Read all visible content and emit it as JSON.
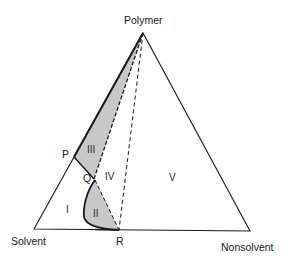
{
  "diagram": {
    "type": "ternary-phase-diagram",
    "vertices": {
      "top": "Polymer",
      "bottom_left": "Solvent",
      "bottom_right": "Nonsolvent"
    },
    "points": {
      "P": "P",
      "Q": "Q",
      "R": "R"
    },
    "regions": {
      "r1": "I",
      "r2": "II",
      "r3": "III",
      "r4": "IV",
      "r5": "V"
    },
    "colors": {
      "line": "#1a1a1a",
      "shade": "#c8c8c8",
      "background": "#ffffff"
    }
  }
}
